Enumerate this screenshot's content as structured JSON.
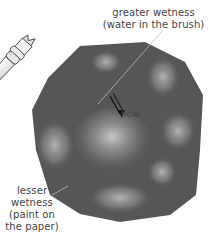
{
  "illustration": {
    "subject": "watercolor paint patch with brush",
    "colors": {
      "paint_dark": "#555555",
      "paint_light": "#9a9a9a",
      "brush_handle": "#e8e8e8",
      "line": "#333333"
    }
  },
  "labels": {
    "greater_line1": "greater wetness",
    "greater_line2": "(water in the brush)",
    "flow": "flow",
    "lesser_line1": "lesser",
    "lesser_line2": "wetness",
    "lesser_line3": "(paint on",
    "lesser_line4": "the paper)"
  }
}
